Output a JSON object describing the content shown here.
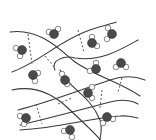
{
  "diagram": {
    "title": "",
    "colors": {
      "chain": "#3a3a3a",
      "crosslink": "#555555",
      "oxygen": "#4a4a4a",
      "hydrogen": "#ffffff"
    },
    "chains": [
      "M10,32 C40,28 60,50 75,62 C95,76 120,82 140,96",
      "M12,72 C40,62 60,40 90,30 C105,25 118,22 116,22",
      "M12,90 C35,85 55,95 70,110 C85,124 100,138 100,140",
      "M18,110 C50,102 80,90 110,80 C128,74 140,78 145,80",
      "M20,125 C50,118 80,110 110,102 C125,98 135,102 138,104",
      "M55,70 C50,60 65,55 75,58 C100,62 120,50 138,40",
      "M60,70 C70,90 90,95 100,120 C103,128 100,136 100,140",
      "M20,130 C60,128 90,118 120,116 C130,115 135,118 138,118"
    ],
    "crosslinks": [
      "M28,34 L32,64",
      "M45,56 L55,68",
      "M78,30 L84,52",
      "M122,78 L118,92",
      "M58,104 L72,98",
      "M36,104 L42,124",
      "M102,90 L100,108"
    ],
    "molecules": [
      {
        "o": [
          22,
          50
        ],
        "h1": [
          16,
          48
        ],
        "h2": [
          20,
          56
        ]
      },
      {
        "o": [
          54,
          34
        ],
        "h1": [
          49,
          32
        ],
        "h2": [
          58,
          29
        ]
      },
      {
        "o": [
          92,
          43
        ],
        "h1": [
          92,
          37
        ],
        "h2": [
          97,
          46
        ]
      },
      {
        "o": [
          112,
          34
        ],
        "h1": [
          108,
          28
        ],
        "h2": [
          107,
          39
        ]
      },
      {
        "o": [
          33,
          75
        ],
        "h1": [
          38,
          73
        ],
        "h2": [
          35,
          81
        ]
      },
      {
        "o": [
          96,
          69
        ],
        "h1": [
          90,
          71
        ],
        "h2": [
          96,
          63
        ]
      },
      {
        "o": [
          65,
          80
        ],
        "h1": [
          62,
          74
        ],
        "h2": [
          67,
          84
        ]
      },
      {
        "o": [
          121,
          63
        ],
        "h1": [
          116,
          67
        ],
        "h2": [
          126,
          67
        ]
      },
      {
        "o": [
          88,
          93
        ],
        "h1": [
          92,
          87
        ],
        "h2": [
          92,
          98
        ]
      },
      {
        "o": [
          26,
          118
        ],
        "h1": [
          20,
          116
        ],
        "h2": [
          24,
          124
        ]
      },
      {
        "o": [
          107,
          117
        ],
        "h1": [
          113,
          119
        ],
        "h2": [
          103,
          123
        ]
      },
      {
        "o": [
          70,
          130
        ],
        "h1": [
          64,
          131
        ],
        "h2": [
          72,
          137
        ]
      }
    ]
  }
}
